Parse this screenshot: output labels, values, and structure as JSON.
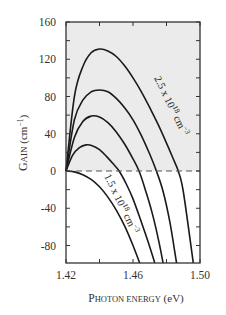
{
  "chart_data": {
    "type": "line",
    "title": "",
    "xlabel": "Photon energy (eV)",
    "ylabel": "Gain (cm⁻¹)",
    "xlim": [
      1.42,
      1.5
    ],
    "ylim": [
      -100,
      160
    ],
    "x_ticks": [
      1.42,
      1.46,
      1.5
    ],
    "x_minor_ticks": [
      1.44,
      1.48
    ],
    "y_ticks": [
      160,
      120,
      80,
      40,
      0,
      -40,
      -80
    ],
    "y_minor_ticks": [
      140,
      100,
      60,
      20,
      -20,
      -60
    ],
    "grid": false,
    "legend": null,
    "shaded_region": {
      "y_from": 0,
      "y_to": 160,
      "color": "#ebebeb",
      "description": "positive gain region"
    },
    "zero_line": {
      "y": 0,
      "style": "dashed"
    },
    "series": [
      {
        "name": "2.5 x 10^18 cm^-3",
        "x": [
          1.42,
          1.425,
          1.43,
          1.435,
          1.44,
          1.445,
          1.45,
          1.455,
          1.46,
          1.465,
          1.47,
          1.475,
          1.48,
          1.485,
          1.487,
          1.49,
          1.496
        ],
        "y": [
          0,
          80,
          112,
          127,
          131,
          129,
          123,
          113,
          100,
          85,
          68,
          50,
          30,
          9,
          0,
          -22,
          -99
        ]
      },
      {
        "name": "n2",
        "x": [
          1.42,
          1.425,
          1.43,
          1.435,
          1.44,
          1.445,
          1.45,
          1.455,
          1.46,
          1.465,
          1.47,
          1.474,
          1.478,
          1.482,
          1.486
        ],
        "y": [
          0,
          55,
          76,
          85,
          87,
          85,
          78,
          68,
          55,
          38,
          18,
          0,
          -22,
          -55,
          -99
        ]
      },
      {
        "name": "n3",
        "x": [
          1.42,
          1.425,
          1.43,
          1.435,
          1.44,
          1.445,
          1.45,
          1.455,
          1.46,
          1.4636,
          1.467,
          1.471,
          1.475,
          1.478
        ],
        "y": [
          0,
          36,
          53,
          59,
          58,
          52,
          42,
          29,
          13,
          0,
          -18,
          -42,
          -72,
          -99
        ]
      },
      {
        "name": "n4",
        "x": [
          1.42,
          1.424,
          1.428,
          1.432,
          1.436,
          1.44,
          1.444,
          1.448,
          1.4517,
          1.456,
          1.46,
          1.465,
          1.469,
          1.473
        ],
        "y": [
          0,
          17,
          25,
          28,
          27,
          23,
          16,
          8,
          0,
          -14,
          -30,
          -55,
          -76,
          -99
        ]
      },
      {
        "name": "1.5 x 10^18 cm^-3",
        "x": [
          1.42,
          1.425,
          1.43,
          1.435,
          1.44,
          1.445,
          1.45,
          1.455,
          1.46,
          1.464
        ],
        "y": [
          0,
          -1,
          -4,
          -9,
          -17,
          -28,
          -42,
          -59,
          -80,
          -99
        ]
      }
    ],
    "annotations": [
      {
        "text": "2.5 x 10¹⁸ cm⁻³",
        "near_series": 0
      },
      {
        "text": "1.5 x 10¹⁸ cm⁻³",
        "near_series": 4
      }
    ]
  },
  "labels": {
    "y_axis_small_caps_first": "G",
    "y_axis_small_caps_rest": "AIN",
    "y_axis_unit": " (cm",
    "y_axis_unit_sup": "−1",
    "y_axis_unit_close": ")",
    "x_axis_cap_first": "P",
    "x_axis_cap_rest": "HOTON ENERGY",
    "x_axis_unit": " (eV)",
    "annot_high_base": "2.5 x 10",
    "annot_high_exp": "18",
    "annot_high_unit": " cm",
    "annot_high_unit_exp": "−3",
    "annot_low_base": "1.5 x 10",
    "annot_low_exp": "18",
    "annot_low_unit": " cm",
    "annot_low_unit_exp": "−3"
  },
  "colors": {
    "curve": "#1a1a1a",
    "frame": "#333333",
    "shade": "#ebebeb",
    "dash": "#555555"
  }
}
